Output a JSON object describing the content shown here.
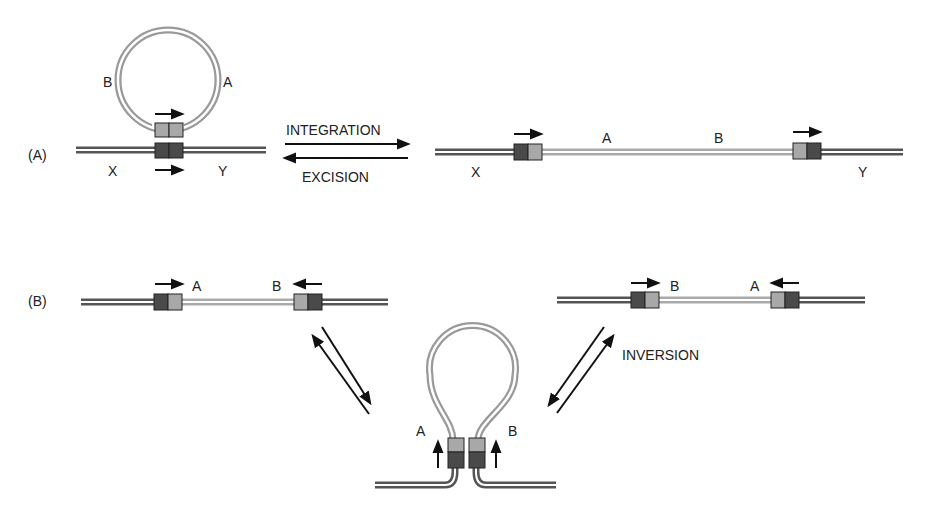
{
  "panel_a": {
    "label": "(A)",
    "circle_label_left": "B",
    "circle_label_right": "A",
    "left_flank": "X",
    "right_flank": "Y",
    "forward_reaction": "INTEGRATION",
    "reverse_reaction": "EXCISION",
    "integrated_label_1": "A",
    "integrated_label_2": "B",
    "integrated_left_flank": "X",
    "integrated_right_flank": "Y"
  },
  "panel_b": {
    "label": "(B)",
    "left_seg_label_1": "A",
    "left_seg_label_2": "B",
    "right_seg_label_1": "B",
    "right_seg_label_2": "A",
    "loop_label_left": "A",
    "loop_label_right": "B",
    "reaction": "INVERSION"
  },
  "colors": {
    "dna_outer": "#555555",
    "dna_inner_gap": "#ffffff",
    "insert_dna": "#aaaaaa",
    "site_dark": "#4a4a4a",
    "site_light": "#a8a8a8",
    "arrow": "#111111"
  }
}
